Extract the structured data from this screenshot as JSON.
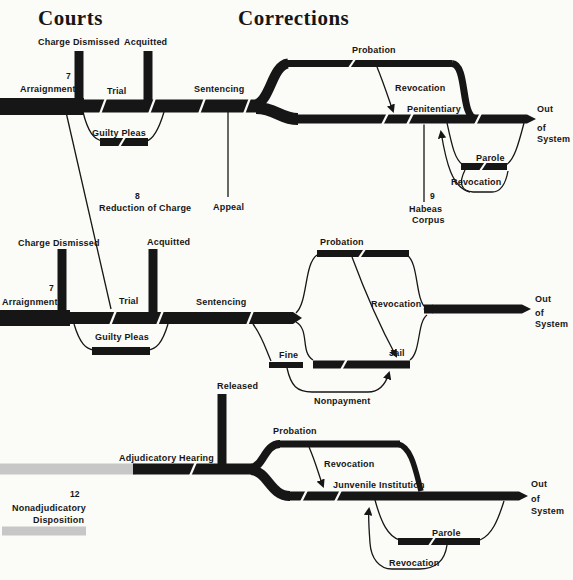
{
  "colors": {
    "ink": "#161616",
    "gray_band": "#c7c7c7",
    "paper": "#fbfbf8"
  },
  "headings": {
    "courts": "Courts",
    "corrections": "Corrections"
  },
  "felony_track": {
    "charge_dismissed": "Charge Dismissed",
    "acquitted": "Acquitted",
    "footnote_arraignment": "7",
    "arraignment": "Arraignment",
    "trial": "Trial",
    "guilty_pleas": "Guilty Pleas",
    "sentencing": "Sentencing",
    "footnote_reduction": "8",
    "reduction_of_charge": "Reduction of Charge",
    "appeal": "Appeal",
    "probation": "Probation",
    "probation_revocation": "Revocation",
    "penitentiary": "Penitentiary",
    "parole": "Parole",
    "parole_revocation": "Revocation",
    "footnote_habeas": "9",
    "habeas_line1": "Habeas",
    "habeas_line2": "Corpus",
    "out_line1": "Out",
    "out_line2": "of",
    "out_line3": "System"
  },
  "misdemeanor_track": {
    "charge_dismissed": "Charge Dismissed",
    "acquitted": "Acquitted",
    "footnote_arraignment": "7",
    "arraignment": "Arraignment",
    "trial": "Trial",
    "guilty_pleas": "Guilty Pleas",
    "sentencing": "Sentencing",
    "probation": "Probation",
    "revocation": "Revocation",
    "jail": "Jail",
    "fine": "Fine",
    "nonpayment": "Nonpayment",
    "out_line1": "Out",
    "out_line2": "of",
    "out_line3": "System"
  },
  "juvenile_track": {
    "released": "Released",
    "adjudicatory_hearing": "Adjudicatory Hearing",
    "footnote_nonadjudicatory": "12",
    "nonadjudicatory_line1": "Nonadjudicatory",
    "nonadjudicatory_line2": "Disposition",
    "probation": "Probation",
    "probation_revocation": "Revocation",
    "juvenile_institution": "Junvenile Institution",
    "parole": "Parole",
    "parole_revocation": "Revocation",
    "out_line1": "Out",
    "out_line2": "of",
    "out_line3": "System"
  }
}
